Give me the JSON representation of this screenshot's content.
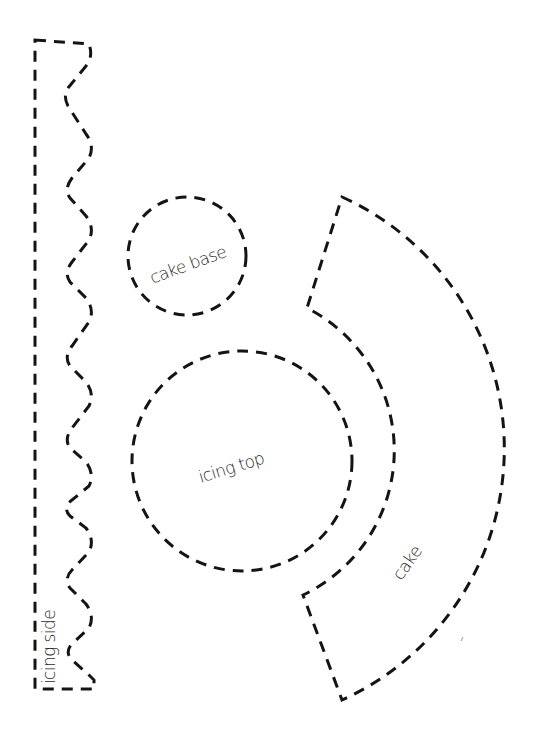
{
  "template": {
    "pieces": [
      {
        "id": "icing-side",
        "label": "icing side",
        "shape": "strip with zigzag edge"
      },
      {
        "id": "cake-base",
        "label": "cake base",
        "shape": "circle"
      },
      {
        "id": "icing-top",
        "label": "icing top",
        "shape": "circle"
      },
      {
        "id": "cake",
        "label": "cake",
        "shape": "annular sector"
      }
    ],
    "line_style": "dashed",
    "line_color": "#141414",
    "text_color": "#2b2b2b",
    "background": "#ffffff"
  }
}
